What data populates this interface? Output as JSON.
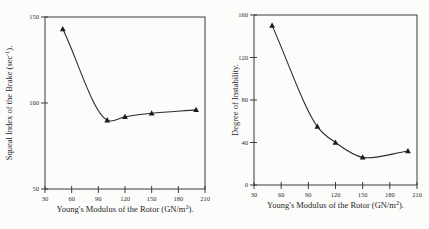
{
  "figure": {
    "background": "#fcfcfa",
    "ink_color": "#2b2b2b",
    "description_left_chart": "Squeal Index of the Brake vs Young's Modulus of the Rotor",
    "description_right_chart": "Degree of Instability vs Young's Modulus of the Rotor"
  },
  "chart_data": [
    {
      "type": "line",
      "title": "",
      "xlabel": {
        "pre": "Young's Modulus of the Rotor (GN/m",
        "sup": "2",
        "post": ")."
      },
      "ylabel": {
        "pre": "Squeal Index of the Brake (sec",
        "sup": "-1",
        "post": ")."
      },
      "x": [
        50,
        100,
        120,
        150,
        200
      ],
      "y": [
        143,
        90,
        92,
        94,
        96
      ],
      "xlim": [
        30,
        210
      ],
      "ylim": [
        50,
        150
      ],
      "xticks": [
        30,
        60,
        90,
        120,
        150,
        180,
        210
      ],
      "yticks": [
        50,
        100,
        150
      ],
      "marker": "filled-triangle-up",
      "line_color": "#2b2b2b",
      "grid": false,
      "legend": null
    },
    {
      "type": "line",
      "title": "",
      "xlabel": {
        "pre": "Young's Modulus of the Rotor (GN/m",
        "sup": "2",
        "post": ")."
      },
      "ylabel": {
        "pre": "Degree of Instability.",
        "sup": "",
        "post": ""
      },
      "x": [
        50,
        100,
        120,
        150,
        200
      ],
      "y": [
        150,
        55,
        40,
        26,
        32
      ],
      "xlim": [
        30,
        210
      ],
      "ylim": [
        0,
        160
      ],
      "xticks": [
        30,
        60,
        90,
        120,
        150,
        180,
        210
      ],
      "yticks": [
        0,
        40,
        80,
        120,
        160
      ],
      "marker": "filled-triangle-up",
      "line_color": "#2b2b2b",
      "grid": false,
      "legend": null
    }
  ]
}
